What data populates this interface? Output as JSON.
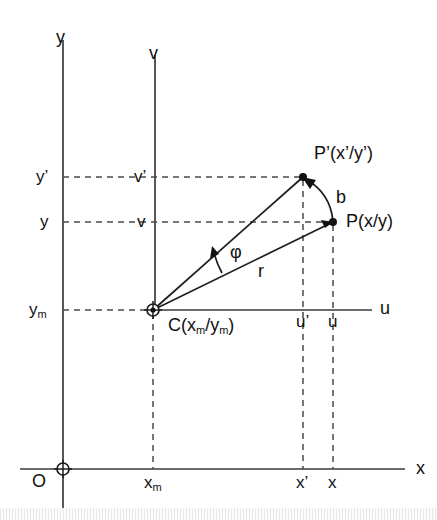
{
  "figure": {
    "type": "geometry-diagram",
    "background_color": "#ffffff",
    "line_color": "#1d1d1d",
    "axis_color": "#3a3a3a",
    "dash_color": "#4a4a4a"
  },
  "axes": {
    "global": {
      "origin_label": "O",
      "x_axis_label": "x",
      "y_axis_label": "y",
      "origin_px": {
        "x": 63,
        "y": 469
      }
    },
    "local": {
      "u_axis_label": "u",
      "v_axis_label": "v",
      "centre_px": {
        "x": 153,
        "y": 310
      }
    }
  },
  "points": {
    "centre": {
      "name": "C",
      "label": "C(x",
      "label_sub1": "m",
      "label_mid": "/y",
      "label_sub2": "m",
      "label_end": ")",
      "full_label": "C(xm/ym)",
      "px": {
        "x": 153,
        "y": 310
      },
      "marker": "circle-crosshair"
    },
    "p": {
      "name": "P",
      "label": "P(x/y)",
      "px": {
        "x": 333,
        "y": 222
      },
      "marker": "filled-dot"
    },
    "p_prime": {
      "name": "P'",
      "label": "P'(x'/y')",
      "px": {
        "x": 303,
        "y": 177
      },
      "marker": "filled-dot"
    }
  },
  "segments": {
    "radius": {
      "label": "r",
      "from": "C",
      "to": "P"
    },
    "radius_prime": {
      "label": "",
      "from": "C",
      "to": "P'"
    },
    "arc": {
      "label": "b",
      "from": "P",
      "to": "P'",
      "arrow": "to-p-prime"
    },
    "angle": {
      "label": "φ",
      "at": "C",
      "between": [
        "C-P",
        "C-P'"
      ],
      "arrow": "ccw"
    }
  },
  "tick_labels": {
    "y_axis": [
      {
        "text": "y",
        "prime": true,
        "y_px": 177
      },
      {
        "text": "y",
        "prime": false,
        "y_px": 222
      },
      {
        "text": "y",
        "sub": "m",
        "y_px": 310
      }
    ],
    "v_axis": [
      {
        "text": "v",
        "prime": true,
        "y_px": 177
      },
      {
        "text": "v",
        "prime": false,
        "y_px": 222
      }
    ],
    "u_axis": [
      {
        "text": "u",
        "prime": true,
        "x_px": 303
      },
      {
        "text": "u",
        "prime": false,
        "x_px": 333
      }
    ],
    "x_axis": [
      {
        "text": "x",
        "sub": "m",
        "x_px": 153
      },
      {
        "text": "x",
        "prime": true,
        "x_px": 303
      },
      {
        "text": "x",
        "prime": false,
        "x_px": 333
      }
    ]
  },
  "labels": {
    "y": "y",
    "y_prime": "y’",
    "y_m": "y",
    "y_m_sub": "m",
    "v": "v",
    "v_prime": "v’",
    "u": "u",
    "u_prime": "u’",
    "x": "x",
    "x_prime": "x’",
    "x_m": "x",
    "x_m_sub": "m",
    "origin": "O",
    "phi": "φ",
    "r": "r",
    "b": "b",
    "point_p": "P(x/y)",
    "point_p_prime": "P’(x’/y’)",
    "centre_c_head": "C(x",
    "centre_c_sub1": "m",
    "centre_c_mid": "/y",
    "centre_c_sub2": "m",
    "centre_c_tail": ")"
  }
}
